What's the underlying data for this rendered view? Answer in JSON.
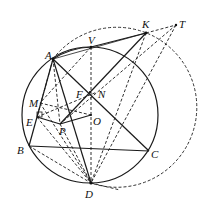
{
  "diagram": {
    "type": "geometry",
    "points": {
      "A": {
        "label": "A",
        "x": 53,
        "y": 59
      },
      "V": {
        "label": "V",
        "x": 91,
        "y": 47
      },
      "K": {
        "label": "K",
        "x": 146,
        "y": 33
      },
      "T": {
        "label": "T",
        "x": 176,
        "y": 25
      },
      "F": {
        "label": "F",
        "x": 90,
        "y": 92
      },
      "N": {
        "label": "N",
        "x": 97,
        "y": 92
      },
      "M": {
        "label": "M",
        "x": 40,
        "y": 103
      },
      "E": {
        "label": "E",
        "x": 37,
        "y": 117
      },
      "P": {
        "label": "P",
        "x": 60,
        "y": 124
      },
      "O": {
        "label": "O",
        "x": 91,
        "y": 115
      },
      "B": {
        "label": "B",
        "x": 29,
        "y": 146
      },
      "C": {
        "label": "C",
        "x": 149,
        "y": 151
      },
      "D": {
        "label": "D",
        "x": 91,
        "y": 183
      }
    },
    "circles": [
      {
        "name": "circumcircle-ABC",
        "style": "solid",
        "cx": 90,
        "cy": 115,
        "r": 68
      },
      {
        "name": "circle-ADK",
        "style": "dashed",
        "cx": 122,
        "cy": 108,
        "r": 80
      }
    ],
    "solid_segments": [
      [
        "A",
        "B"
      ],
      [
        "B",
        "C"
      ],
      [
        "A",
        "C"
      ],
      [
        "A",
        "D"
      ],
      [
        "A",
        "V"
      ],
      [
        "V",
        "K"
      ],
      [
        "A",
        "K"
      ],
      [
        "P",
        "K"
      ],
      [
        "P",
        "O"
      ],
      [
        "E",
        "P"
      ],
      [
        "V",
        "O"
      ],
      [
        "B",
        "E"
      ]
    ],
    "dashed_segments": [
      [
        "A",
        "T"
      ],
      [
        "K",
        "T"
      ],
      [
        "K",
        "D"
      ],
      [
        "T",
        "D"
      ],
      [
        "V",
        "D"
      ],
      [
        "A",
        "M"
      ],
      [
        "A",
        "P"
      ],
      [
        "M",
        "O"
      ],
      [
        "E",
        "D"
      ],
      [
        "B",
        "D"
      ],
      [
        "M",
        "D"
      ],
      [
        "P",
        "D"
      ],
      [
        "E",
        "N"
      ],
      [
        "O",
        "D"
      ],
      [
        "A",
        "E"
      ],
      [
        "P",
        "T"
      ]
    ]
  }
}
